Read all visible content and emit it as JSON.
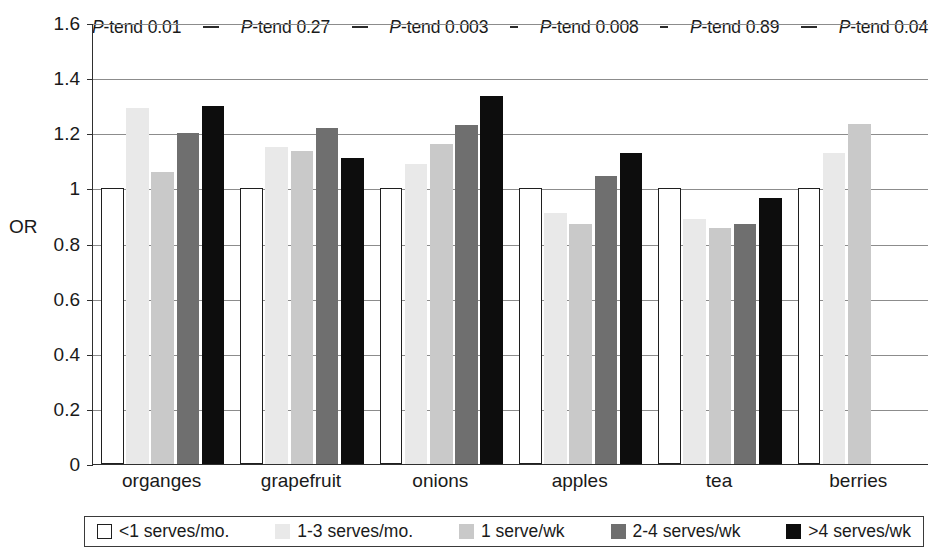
{
  "chart_data": {
    "type": "bar",
    "title": "",
    "xlabel": "",
    "ylabel": "OR",
    "ylim": [
      0,
      1.6
    ],
    "ytick_values": [
      0,
      0.2,
      0.4,
      0.6,
      0.8,
      1,
      1.2,
      1.4,
      1.6
    ],
    "ytick_labels": [
      "0",
      "0.2",
      "0.4",
      "0.6",
      "0.8",
      "1",
      "1.2",
      "1.4",
      "1.6"
    ],
    "grid": true,
    "legend_position": "bottom",
    "categories": [
      "organges",
      "grapefruit",
      "onions",
      "apples",
      "tea",
      "berries"
    ],
    "series": [
      {
        "name": "<1 serves/mo.",
        "color": "#ffffff",
        "values": [
          1.0,
          1.0,
          1.0,
          1.0,
          1.0,
          1.0
        ]
      },
      {
        "name": "1-3 serves/mo.",
        "color": "#e9e9e9",
        "values": [
          1.29,
          1.15,
          1.09,
          0.91,
          0.89,
          1.13
        ]
      },
      {
        "name": "1 serve/wk",
        "color": "#c9c9c9",
        "values": [
          1.06,
          1.135,
          1.16,
          0.87,
          0.855,
          1.235
        ]
      },
      {
        "name": "2-4 serves/wk",
        "color": "#6f6f6f",
        "values": [
          1.2,
          1.22,
          1.23,
          1.045,
          0.87,
          null
        ]
      },
      {
        "name": ">4 serves/wk",
        "color": "#0d0d0d",
        "values": [
          1.3,
          1.11,
          1.335,
          1.13,
          0.965,
          null
        ]
      }
    ],
    "annotations": [
      {
        "text": "P-tend 0.01",
        "category": "organges"
      },
      {
        "text": "P-tend 0.27",
        "category": "grapefruit"
      },
      {
        "text": "P-tend 0.003",
        "category": "onions"
      },
      {
        "text": "P-tend 0.008",
        "category": "apples"
      },
      {
        "text": "P-tend 0.89",
        "category": "tea"
      },
      {
        "text": "P-tend 0.04",
        "category": "berries"
      }
    ]
  },
  "ptrend": [
    {
      "prefix": "P",
      "suffix": "-tend 0.01"
    },
    {
      "prefix": "P",
      "suffix": "-tend 0.27"
    },
    {
      "prefix": "P",
      "suffix": "-tend 0.003"
    },
    {
      "prefix": "P",
      "suffix": "-tend 0.008"
    },
    {
      "prefix": "P",
      "suffix": "-tend 0.89"
    },
    {
      "prefix": "P",
      "suffix": "-tend 0.04"
    }
  ],
  "axis": {
    "y_title": "OR"
  },
  "legend": {
    "items": [
      {
        "label": "<1 serves/mo.",
        "swatch": "white-square-outline"
      },
      {
        "label": "1-3 serves/mo.",
        "swatch": "very-light-gray-square"
      },
      {
        "label": "1 serve/wk",
        "swatch": "light-gray-square"
      },
      {
        "label": "2-4 serves/wk",
        "swatch": "dark-gray-square"
      },
      {
        "label": ">4 serves/wk",
        "swatch": "black-square"
      }
    ]
  }
}
